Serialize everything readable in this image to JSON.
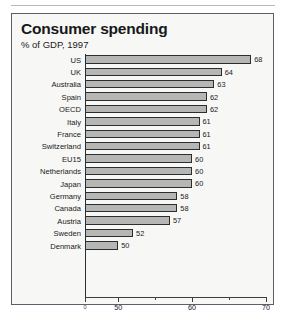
{
  "chart_data": {
    "type": "bar",
    "orientation": "horizontal",
    "title": "Consumer spending",
    "subtitle": "% of GDP, 1997",
    "xlabel": "",
    "ylabel": "",
    "xlim": [
      45.5,
      70
    ],
    "grid": false,
    "legend": null,
    "categories": [
      "US",
      "UK",
      "Australia",
      "Spain",
      "OECD",
      "Italy",
      "France",
      "Switzerland",
      "EU15",
      "Netherlands",
      "Japan",
      "Germany",
      "Canada",
      "Austria",
      "Sweden",
      "Denmark"
    ],
    "values": [
      68,
      64,
      63,
      62,
      62,
      61,
      61,
      61,
      60,
      60,
      60,
      58,
      58,
      57,
      52,
      50
    ],
    "value_labels": [
      "68",
      "64",
      "63",
      "62",
      "62",
      "61",
      "61",
      "61",
      "60",
      "60",
      "60",
      "58",
      "58",
      "57",
      "52",
      "50"
    ],
    "xticks": [
      50,
      60,
      70
    ],
    "xtick_labels": [
      "50",
      "60",
      "70"
    ],
    "xminor_ticks": [
      55,
      65
    ],
    "origin_label": "0",
    "colors": {
      "bar_fill": "#b6b6b4",
      "bar_border": "#2b2e31",
      "axis": "#3a3e42",
      "frame": "#59606a",
      "background": "#f7f7f5",
      "text": "#17191b"
    }
  }
}
